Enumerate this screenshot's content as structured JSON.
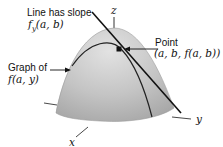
{
  "figure": {
    "axes": {
      "x_label": "x",
      "y_label": "y",
      "z_label": "z"
    },
    "annotations": {
      "slope_label": "Line has slope",
      "slope_expr": "f_y(a, b)",
      "slope_expr_display": "fy(a, b)",
      "graph_label": "Graph of",
      "graph_expr": "f(a, y)",
      "point_label": "Point",
      "point_expr": "(a, b, f(a, b))"
    },
    "colors": {
      "surface_light": "#d6d6d6",
      "surface_dark": "#a8a8a8",
      "lines": "#111111",
      "background": "#ffffff"
    }
  }
}
